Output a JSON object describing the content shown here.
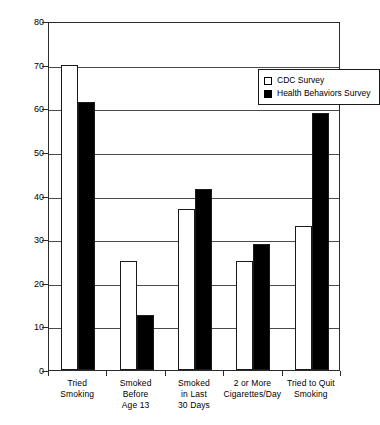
{
  "title_remnant": " ",
  "chart_data": {
    "type": "bar",
    "title": "",
    "xlabel": "",
    "ylabel": "Percentage",
    "ylim": [
      0,
      80
    ],
    "ytick_step": 10,
    "yticks": [
      0,
      10,
      20,
      30,
      40,
      50,
      60,
      70,
      80
    ],
    "ytick_labels": [
      "0",
      "10",
      "20",
      "30",
      "40",
      "50",
      "60",
      "70",
      "80"
    ],
    "grid": "horizontal",
    "legend_position": "top-right-inside",
    "categories": [
      "Tried\nSmoking",
      "Smoked\nBefore\nAge 13",
      "Smoked\nin Last\n30 Days",
      "2 or More\nCigarettes/Day",
      "Tried to Quit\nSmoking"
    ],
    "series": [
      {
        "name": "CDC Survey",
        "swatch": "open-square",
        "color": "#ffffff",
        "values": [
          70,
          25,
          37,
          25,
          33
        ]
      },
      {
        "name": "Health Behaviors Survey",
        "swatch": "filled-square",
        "color": "#000000",
        "values": [
          61.5,
          12.7,
          41.5,
          29,
          59
        ]
      }
    ]
  }
}
